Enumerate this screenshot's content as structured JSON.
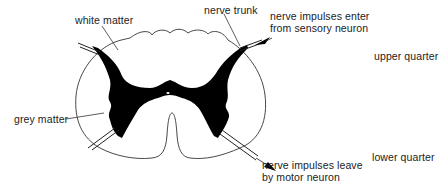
{
  "diagram": {
    "labels": {
      "white_matter": "white matter",
      "nerve_trunk": "nerve trunk",
      "sensory_line1": "nerve impulses enter",
      "sensory_line2": "from sensory neuron",
      "grey_matter": "grey matter",
      "motor_line1": "nerve impulses leave",
      "motor_line2": "by motor neuron",
      "upper_quarter": "upper quarter",
      "lower_quarter": "lower quarter"
    },
    "colors": {
      "outline": "#333333",
      "grey_matter_fill": "#000000",
      "text": "#222222",
      "background": "#ffffff"
    }
  }
}
